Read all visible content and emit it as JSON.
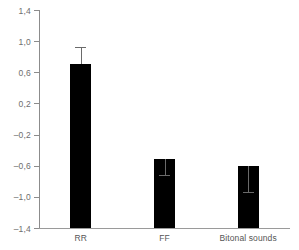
{
  "chart_data": {
    "type": "bar",
    "title": "",
    "subtitle": "",
    "xlabel": "",
    "ylabel": "",
    "categories": [
      "RR",
      "FF",
      "Bitonal sounds"
    ],
    "values": [
      0.71,
      -0.51,
      -0.6
    ],
    "errors": [
      0.21,
      0.21,
      0.34
    ],
    "error_upper": [
      0.92,
      -0.3,
      -0.26
    ],
    "series": [
      {
        "name": "",
        "values": [
          0.71,
          -0.51,
          -0.6
        ],
        "errors": [
          0.21,
          0.21,
          0.34
        ]
      }
    ],
    "ylim": [
      -1.4,
      1.4
    ],
    "ytick_values": [
      1.4,
      1.0,
      0.6,
      0.2,
      -0.2,
      -0.6,
      -1.0,
      -1.4
    ],
    "ytick_labels": [
      "1,4",
      "1,0",
      "0,6",
      "0,2",
      "–0,2",
      "–0,6",
      "–1,0",
      "–1,4"
    ],
    "grid": false,
    "legend": null,
    "legend_position": "none",
    "bar_color": "#000000",
    "axis_color": "#8c8c8c",
    "error_color": "#6a6a6a",
    "label_color": "#6e6e6e",
    "annotations": []
  }
}
